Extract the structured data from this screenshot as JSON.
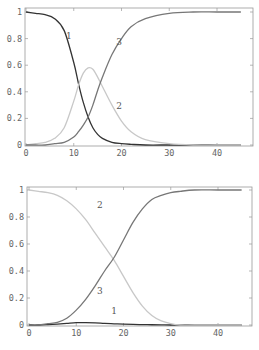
{
  "chart_data": [
    {
      "type": "line",
      "title": "",
      "xlabel": "",
      "ylabel": "",
      "xlim": [
        0,
        46
      ],
      "ylim": [
        0,
        1.03
      ],
      "xticks": [
        "0",
        "10",
        "20",
        "30",
        "40"
      ],
      "yticks": [
        "0",
        "0.2",
        "0.4",
        "0.6",
        "0.8",
        "1"
      ],
      "grid": false,
      "legend": "inline curve labels",
      "x": [
        0,
        2,
        4,
        6,
        8,
        10,
        11,
        12,
        13,
        14,
        15,
        16,
        18,
        20,
        22,
        25,
        30,
        35,
        40,
        45
      ],
      "series": [
        {
          "name": "1",
          "color": "#333333",
          "values": [
            1.0,
            0.99,
            0.98,
            0.95,
            0.86,
            0.62,
            0.46,
            0.32,
            0.21,
            0.13,
            0.08,
            0.05,
            0.02,
            0.01,
            0.005,
            0.0,
            0.0,
            0.0,
            0.0,
            0.0
          ]
        },
        {
          "name": "2",
          "color": "#c8c8c8",
          "values": [
            0.0,
            0.01,
            0.02,
            0.05,
            0.13,
            0.33,
            0.45,
            0.54,
            0.58,
            0.57,
            0.51,
            0.44,
            0.3,
            0.18,
            0.1,
            0.04,
            0.01,
            0.0,
            0.0,
            0.0
          ]
        },
        {
          "name": "3",
          "color": "#777777",
          "values": [
            0.0,
            0.0,
            0.0,
            0.01,
            0.02,
            0.06,
            0.1,
            0.15,
            0.21,
            0.3,
            0.41,
            0.51,
            0.68,
            0.8,
            0.89,
            0.95,
            0.99,
            1.0,
            1.0,
            1.0
          ]
        }
      ],
      "annotations": [
        {
          "text": "1",
          "x": 9.0,
          "y": 0.8
        },
        {
          "text": "2",
          "x": 19.5,
          "y": 0.27
        },
        {
          "text": "3",
          "x": 19.5,
          "y": 0.75
        }
      ]
    },
    {
      "type": "line",
      "title": "",
      "xlabel": "",
      "ylabel": "",
      "xlim": [
        0,
        46
      ],
      "ylim": [
        0,
        1.03
      ],
      "xticks": [
        "0",
        "10",
        "20",
        "30",
        "40"
      ],
      "yticks": [
        "0",
        "0.2",
        "0.4",
        "0.6",
        "0.8",
        "1"
      ],
      "grid": false,
      "legend": "inline curve labels",
      "x": [
        0,
        2,
        4,
        6,
        8,
        10,
        12,
        14,
        16,
        18,
        20,
        22,
        24,
        26,
        28,
        30,
        32,
        35,
        40,
        45
      ],
      "series": [
        {
          "name": "1",
          "color": "#333333",
          "values": [
            0.0,
            0.0,
            0.003,
            0.007,
            0.012,
            0.017,
            0.018,
            0.016,
            0.012,
            0.009,
            0.006,
            0.004,
            0.003,
            0.002,
            0.001,
            0.0,
            0.0,
            0.0,
            0.0,
            0.0
          ]
        },
        {
          "name": "2",
          "color": "#c8c8c8",
          "values": [
            1.0,
            0.99,
            0.98,
            0.96,
            0.92,
            0.86,
            0.78,
            0.68,
            0.58,
            0.48,
            0.36,
            0.24,
            0.14,
            0.07,
            0.03,
            0.01,
            0.0,
            0.0,
            0.0,
            0.0
          ]
        },
        {
          "name": "3",
          "color": "#777777",
          "values": [
            0.0,
            0.0,
            0.01,
            0.02,
            0.05,
            0.11,
            0.19,
            0.29,
            0.4,
            0.5,
            0.63,
            0.76,
            0.86,
            0.93,
            0.96,
            0.98,
            0.99,
            1.0,
            1.0,
            1.0
          ]
        }
      ],
      "annotations": [
        {
          "text": "1",
          "x": 18.0,
          "y": 0.08
        },
        {
          "text": "2",
          "x": 15.0,
          "y": 0.87
        },
        {
          "text": "3",
          "x": 15.0,
          "y": 0.23
        }
      ]
    }
  ]
}
